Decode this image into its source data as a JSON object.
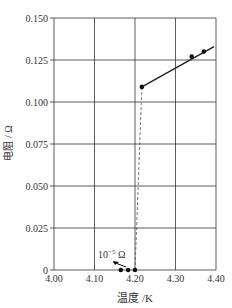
{
  "chart_data": {
    "type": "scatter",
    "title": "",
    "xlabel": "温度 /K",
    "ylabel": "电阻 / Ω",
    "xlim": [
      4.0,
      4.4
    ],
    "ylim": [
      0,
      0.15
    ],
    "grid": true,
    "x_ticks": [
      "4.00",
      "4.10",
      "4.20",
      "4.30",
      "4.40"
    ],
    "y_ticks": [
      "0",
      "0.025",
      "0.050",
      "0.075",
      "0.100",
      "0.125",
      "0.150"
    ],
    "series": [
      {
        "name": "normal state (solid line)",
        "points": [
          [
            4.217,
            0.109
          ],
          [
            4.34,
            0.127
          ],
          [
            4.37,
            0.13
          ]
        ],
        "line": {
          "from": [
            4.217,
            0.109
          ],
          "to": [
            4.395,
            0.133
          ],
          "style": "solid"
        }
      },
      {
        "name": "superconducting state",
        "points": [
          [
            4.165,
            0.0
          ],
          [
            4.183,
            0.0
          ],
          [
            4.2,
            0.0
          ]
        ],
        "line": {
          "from": [
            4.2,
            0.0
          ],
          "to": [
            4.217,
            0.109
          ],
          "style": "dashed"
        }
      }
    ],
    "annotations": [
      {
        "text_base": "10",
        "text_sup": "−5",
        "text_unit": "Ω",
        "arrow_to": [
          4.183,
          0.0
        ]
      }
    ]
  }
}
